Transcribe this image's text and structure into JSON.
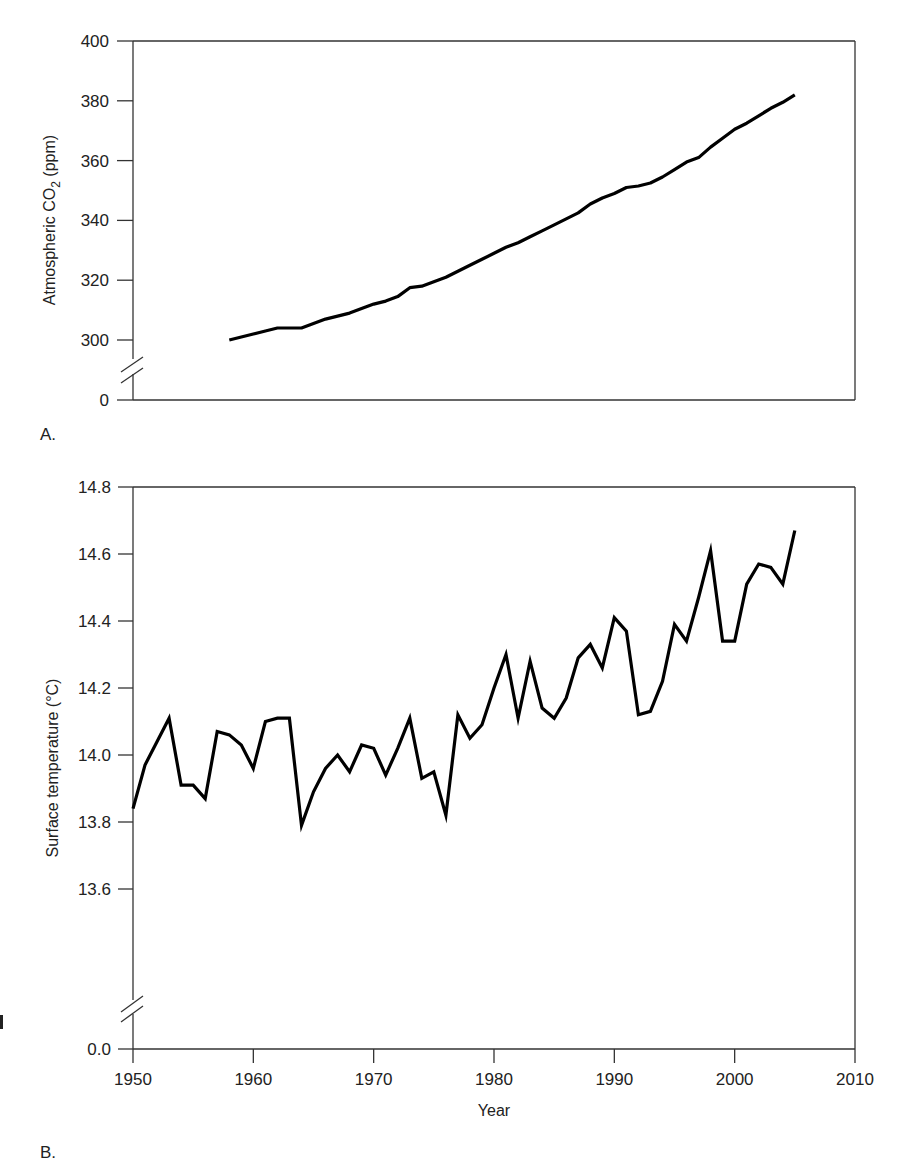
{
  "panels": {
    "a": {
      "label": "A.",
      "ylabel": "Atmospheric CO",
      "ylabel_sub": "2",
      "ylabel_unit": " (ppm)"
    },
    "b": {
      "label": "B.",
      "ylabel": "Surface temperature (°C)",
      "xlabel": "Year"
    }
  },
  "chart_data": [
    {
      "type": "line",
      "title": "",
      "panel": "A",
      "xlabel": "",
      "ylabel": "Atmospheric CO2 (ppm)",
      "xlim": [
        1950,
        2010
      ],
      "ylim": [
        0,
        400
      ],
      "axis_break": [
        0,
        300
      ],
      "yticks": [
        0,
        300,
        320,
        340,
        360,
        380,
        400
      ],
      "grid": false,
      "x": [
        1958,
        1959,
        1960,
        1961,
        1962,
        1963,
        1964,
        1965,
        1966,
        1967,
        1968,
        1969,
        1970,
        1971,
        1972,
        1973,
        1974,
        1975,
        1976,
        1977,
        1978,
        1979,
        1980,
        1981,
        1982,
        1983,
        1984,
        1985,
        1986,
        1987,
        1988,
        1989,
        1990,
        1991,
        1992,
        1993,
        1994,
        1995,
        1996,
        1997,
        1998,
        1999,
        2000,
        2001,
        2002,
        2003,
        2004,
        2005
      ],
      "series": [
        {
          "name": "CO2",
          "values": [
            300,
            301,
            302,
            303,
            304,
            304,
            304,
            305.5,
            307,
            308,
            309,
            310.5,
            312,
            313,
            314.5,
            317.5,
            318,
            319.5,
            321,
            323,
            325,
            327,
            329,
            331,
            332.5,
            334.5,
            336.5,
            338.5,
            340.5,
            342.5,
            345.5,
            347.5,
            349,
            351,
            351.5,
            352.5,
            354.5,
            357,
            359.5,
            361,
            364.5,
            367.5,
            370.5,
            372.5,
            375,
            377.5,
            379.5,
            382
          ]
        }
      ]
    },
    {
      "type": "line",
      "title": "",
      "panel": "B",
      "xlabel": "Year",
      "ylabel": "Surface temperature (°C)",
      "xlim": [
        1950,
        2010
      ],
      "ylim": [
        0.0,
        14.8
      ],
      "axis_break": [
        0.0,
        13.6
      ],
      "xticks": [
        1950,
        1960,
        1970,
        1980,
        1990,
        2000,
        2010
      ],
      "yticks": [
        0.0,
        13.6,
        13.8,
        14.0,
        14.2,
        14.4,
        14.6,
        14.8
      ],
      "grid": false,
      "x": [
        1950,
        1951,
        1952,
        1953,
        1954,
        1955,
        1956,
        1957,
        1958,
        1959,
        1960,
        1961,
        1962,
        1963,
        1964,
        1965,
        1966,
        1967,
        1968,
        1969,
        1970,
        1971,
        1972,
        1973,
        1974,
        1975,
        1976,
        1977,
        1978,
        1979,
        1980,
        1981,
        1982,
        1983,
        1984,
        1985,
        1986,
        1987,
        1988,
        1989,
        1990,
        1991,
        1992,
        1993,
        1994,
        1995,
        1996,
        1997,
        1998,
        1999,
        2000,
        2001,
        2002,
        2003,
        2004,
        2005
      ],
      "series": [
        {
          "name": "Surface temperature",
          "values": [
            13.84,
            13.97,
            14.04,
            14.11,
            13.91,
            13.91,
            13.87,
            14.07,
            14.06,
            14.03,
            13.96,
            14.1,
            14.11,
            14.11,
            13.79,
            13.89,
            13.96,
            14.0,
            13.95,
            14.03,
            14.02,
            13.94,
            14.02,
            14.11,
            13.93,
            13.95,
            13.82,
            14.12,
            14.05,
            14.09,
            14.2,
            14.3,
            14.11,
            14.28,
            14.14,
            14.11,
            14.17,
            14.29,
            14.33,
            14.26,
            14.41,
            14.37,
            14.12,
            14.13,
            14.22,
            14.39,
            14.34,
            14.47,
            14.61,
            14.34,
            14.34,
            14.51,
            14.57,
            14.56,
            14.51,
            14.67
          ]
        }
      ]
    }
  ]
}
